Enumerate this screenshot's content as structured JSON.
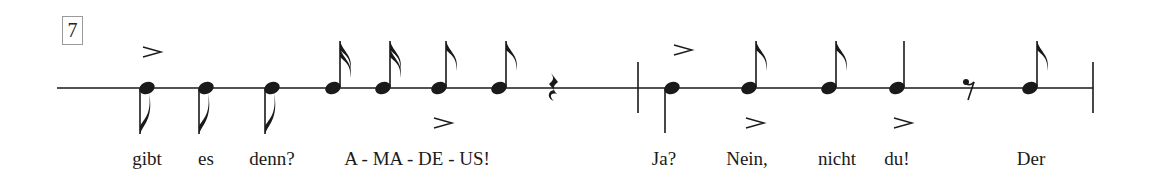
{
  "measure_number": "7",
  "staff": {
    "y": 88,
    "x_start": 57,
    "x_end": 1093,
    "color": "#1a1a1a"
  },
  "barlines": [
    {
      "x": 638,
      "y1": 62,
      "y2": 113
    },
    {
      "x": 1093,
      "y1": 62,
      "y2": 113
    }
  ],
  "notes": [
    {
      "x": 147,
      "type": "eighth",
      "stem": "down"
    },
    {
      "x": 206,
      "type": "eighth",
      "stem": "down"
    },
    {
      "x": 272,
      "type": "eighth",
      "stem": "down"
    },
    {
      "x": 333,
      "type": "sixteenth",
      "stem": "up"
    },
    {
      "x": 383,
      "type": "sixteenth",
      "stem": "up"
    },
    {
      "x": 439,
      "type": "eighth",
      "stem": "up"
    },
    {
      "x": 499,
      "type": "eighth",
      "stem": "up"
    },
    {
      "x": 672,
      "type": "quarter",
      "stem": "down"
    },
    {
      "x": 749,
      "type": "eighth",
      "stem": "up"
    },
    {
      "x": 829,
      "type": "eighth",
      "stem": "up"
    },
    {
      "x": 897,
      "type": "quarter",
      "stem": "up"
    },
    {
      "x": 1030,
      "type": "eighth",
      "stem": "up"
    }
  ],
  "rests": [
    {
      "x": 553,
      "type": "quarter-rest"
    },
    {
      "x": 969,
      "type": "eighth-rest"
    }
  ],
  "accents": [
    {
      "x": 152,
      "y": 52,
      "position": "above"
    },
    {
      "x": 443,
      "y": 123,
      "position": "below"
    },
    {
      "x": 683,
      "y": 50,
      "position": "above"
    },
    {
      "x": 755,
      "y": 123,
      "position": "below"
    },
    {
      "x": 903,
      "y": 123,
      "position": "below"
    }
  ],
  "lyrics": [
    {
      "x": 147,
      "text": "gibt"
    },
    {
      "x": 206,
      "text": "es"
    },
    {
      "x": 272,
      "text": "denn?"
    },
    {
      "x": 417,
      "text": "A - MA - DE - US!"
    },
    {
      "x": 664,
      "text": "Ja?"
    },
    {
      "x": 747,
      "text": "Nein,"
    },
    {
      "x": 837,
      "text": "nicht"
    },
    {
      "x": 897,
      "text": "du!"
    },
    {
      "x": 1031,
      "text": "Der"
    }
  ]
}
